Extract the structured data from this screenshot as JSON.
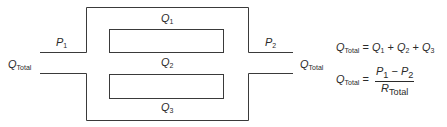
{
  "diagram": {
    "line_color": "#3a3a3a",
    "labels": {
      "p1": {
        "main": "P",
        "sub": "1"
      },
      "p2": {
        "main": "P",
        "sub": "2"
      },
      "q_total_left": {
        "main": "Q",
        "sub": "Total"
      },
      "q_total_right": {
        "main": "Q",
        "sub": "Total"
      },
      "q1": {
        "main": "Q",
        "sub": "1"
      },
      "q2": {
        "main": "Q",
        "sub": "2"
      },
      "q3": {
        "main": "Q",
        "sub": "3"
      }
    }
  },
  "equations": {
    "sum": {
      "lhs_main": "Q",
      "lhs_sub": "Total",
      "equals": "=",
      "t1_main": "Q",
      "t1_sub": "1",
      "plus1": "+",
      "t2_main": "Q",
      "t2_sub": "2",
      "plus2": "+",
      "t3_main": "Q",
      "t3_sub": "3"
    },
    "resistance": {
      "lhs_main": "Q",
      "lhs_sub": "Total",
      "equals": "=",
      "num_a_main": "P",
      "num_a_sub": "1",
      "minus": "−",
      "num_b_main": "P",
      "num_b_sub": "2",
      "den_main": "R",
      "den_sub": "Total"
    }
  }
}
